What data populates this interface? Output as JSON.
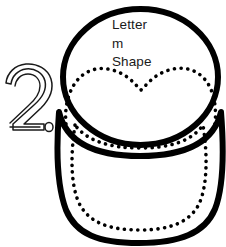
{
  "page": {
    "title": "Letter m Shape",
    "kind": "craft-template-worksheet",
    "background_color": "#ffffff",
    "ink_color": "#000000",
    "text_color": "#1a1a1a"
  },
  "step_number": {
    "value": "2",
    "period": ".",
    "style": "hollow-outline"
  },
  "annotation": {
    "line1": "Letter",
    "line2": "m",
    "line3": "Shape"
  },
  "shapes": {
    "head": {
      "name": "head-ellipse",
      "stroke_color": "#000000",
      "fill_color": "#ffffff",
      "stroke_width": 6
    },
    "body": {
      "name": "body-rounded-shape",
      "stroke_color": "#000000",
      "fill_color": "#ffffff",
      "stroke_width": 6
    },
    "m_cut_line": {
      "name": "dashed-m-cut-line",
      "stroke_color": "#000000",
      "style": "dashed",
      "stroke_width": 3.6
    },
    "body_cut_line": {
      "name": "dashed-body-cut-line",
      "stroke_color": "#000000",
      "style": "dashed",
      "stroke_width": 3.6
    }
  }
}
